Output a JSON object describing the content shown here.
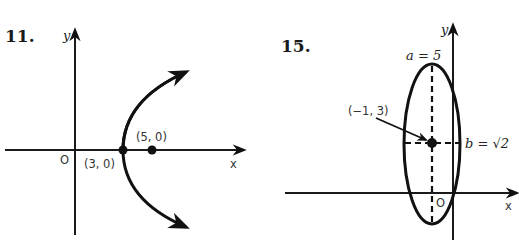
{
  "figures": [
    {
      "number": "11.",
      "type": "parabola",
      "axes": {
        "x_label": "x",
        "y_label": "y",
        "origin_label": "O"
      },
      "points": [
        {
          "label": "(3, 0)",
          "role": "vertex"
        },
        {
          "label": "(5, 0)",
          "role": "focus"
        }
      ]
    },
    {
      "number": "15.",
      "type": "ellipse",
      "axes": {
        "x_label": "x",
        "y_label": "y",
        "origin_label": "O"
      },
      "center": {
        "label": "(−1, 3)"
      },
      "semi_major": {
        "label": "a = 5"
      },
      "semi_minor": {
        "label": "b = √2"
      }
    }
  ],
  "colors": {
    "ink": "#111111",
    "label": "#333333",
    "background": "#ffffff"
  }
}
